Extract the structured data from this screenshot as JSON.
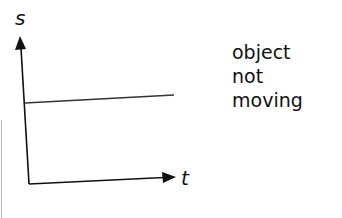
{
  "diagram": {
    "type": "displacement-time graph",
    "y_axis_label": "s",
    "x_axis_label": "t",
    "line": "horizontal (constant displacement)",
    "caption_lines": [
      "object",
      "not",
      "moving"
    ],
    "line_color": "#333333"
  }
}
